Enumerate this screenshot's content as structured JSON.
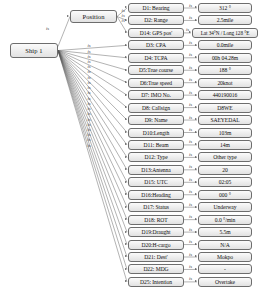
{
  "diagram": {
    "type": "semantic-network",
    "root": {
      "label": "Ship 1"
    },
    "groups": [
      {
        "id": "position",
        "label": "Position"
      }
    ],
    "edge_label": "is",
    "root_to_group_label": "is",
    "attributes": [
      {
        "id": "d1",
        "label": "D1: Bearing",
        "value": "312 °",
        "group": "position"
      },
      {
        "id": "d2",
        "label": "D2: Range",
        "value": "2.5mile",
        "group": "position"
      },
      {
        "id": "d14",
        "label": "D14: GPS pos'",
        "value": "Lat 34°N / Long 128 °E",
        "group": "position"
      },
      {
        "id": "d3",
        "label": "D3: CPA",
        "value": "0.0mile",
        "group": "root"
      },
      {
        "id": "d4",
        "label": "D4: TCPA",
        "value": "00h 04.28m",
        "group": "root"
      },
      {
        "id": "d5",
        "label": "D5:True course",
        "value": "188 °",
        "group": "root"
      },
      {
        "id": "d6",
        "label": "D6:True speed",
        "value": "20knot",
        "group": "root"
      },
      {
        "id": "d7",
        "label": "D7: IMO No.",
        "value": "440190016",
        "group": "root"
      },
      {
        "id": "d8",
        "label": "D8: Callsign",
        "value": "D8WE",
        "group": "root"
      },
      {
        "id": "d9",
        "label": "D9: Name",
        "value": "SAEYEDAL",
        "group": "root"
      },
      {
        "id": "d10",
        "label": "D10:Length",
        "value": "103m",
        "group": "root"
      },
      {
        "id": "d11",
        "label": "D11: Beam",
        "value": "14m",
        "group": "root"
      },
      {
        "id": "d12",
        "label": "D12: Type",
        "value": "Other type",
        "group": "root"
      },
      {
        "id": "d13",
        "label": "D13:Antenna",
        "value": "20",
        "group": "root"
      },
      {
        "id": "d15",
        "label": "D15: UTC",
        "value": "02:05",
        "group": "root"
      },
      {
        "id": "d16",
        "label": "D16:Heading",
        "value": "000 °",
        "group": "root"
      },
      {
        "id": "d17",
        "label": "D17: Status",
        "value": "Underway",
        "group": "root"
      },
      {
        "id": "d18",
        "label": "D18: ROT",
        "value": "0.0 °/min",
        "group": "root"
      },
      {
        "id": "d19",
        "label": "D19:Draught",
        "value": "5.5m",
        "group": "root"
      },
      {
        "id": "d20",
        "label": "D20:H-cargo",
        "value": "N/A",
        "group": "root"
      },
      {
        "id": "d21",
        "label": "D21: Dest'",
        "value": "Mokpo",
        "group": "root"
      },
      {
        "id": "d22",
        "label": "D22: MDG",
        "value": "-",
        "group": "root"
      },
      {
        "id": "d25",
        "label": "D25: Intention",
        "value": "Overtake",
        "group": "root"
      }
    ],
    "colors": {
      "node_border": "#6d6d6d",
      "node_fill": "#ededed",
      "edge": "#555555",
      "text": "#111111"
    }
  }
}
